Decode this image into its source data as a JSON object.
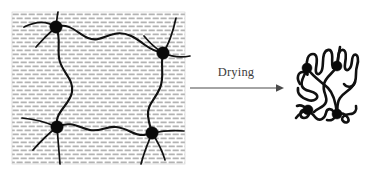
{
  "figure": {
    "canvas": {
      "width": 374,
      "height": 169,
      "background": "#ffffff"
    },
    "arrow": {
      "label": "Drying",
      "label_x": 236,
      "label_y": 75,
      "x1": 190,
      "x2": 277,
      "y": 88,
      "color": "#4a4a4a"
    },
    "swollen_gel": {
      "name": "Swollen hydrogel network",
      "x": 12,
      "y": 12,
      "width": 173,
      "height": 152,
      "solvent_fill_color": "#b3b3b3",
      "solvent_background": "#ffffff",
      "chain_color": "#111111",
      "node_color": "#0a0a0a",
      "node_count": 4,
      "nodes": [
        {
          "id": "n1",
          "cx": 56,
          "cy": 27,
          "r": 6.2
        },
        {
          "id": "n2",
          "cx": 163,
          "cy": 53,
          "r": 6.2
        },
        {
          "id": "n3",
          "cx": 57,
          "cy": 127,
          "r": 6.2
        },
        {
          "id": "n4",
          "cx": 152,
          "cy": 133,
          "r": 6.2
        }
      ]
    },
    "dried_network": {
      "name": "Collapsed dried polymer network",
      "x": 295,
      "y": 46,
      "width": 66,
      "height": 78,
      "chain_color": "#111111",
      "node_color": "#0a0a0a",
      "node_count": 4,
      "nodes": [
        {
          "id": "d1",
          "cx": 307,
          "cy": 68,
          "r": 5.0
        },
        {
          "id": "d2",
          "cx": 337,
          "cy": 66,
          "r": 5.0
        },
        {
          "id": "d3",
          "cx": 308,
          "cy": 110,
          "r": 5.0
        },
        {
          "id": "d4",
          "cx": 337,
          "cy": 114,
          "r": 5.0
        }
      ]
    }
  }
}
